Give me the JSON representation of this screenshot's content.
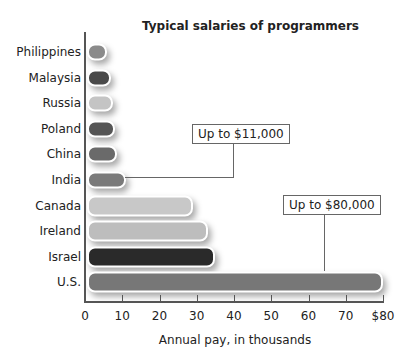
{
  "chart_data": {
    "type": "bar",
    "orientation": "horizontal",
    "title": "Typical salaries of programmers",
    "xlabel": "Annual pay, in thousands",
    "ylabel": "",
    "xlim": [
      0,
      80
    ],
    "xticks": [
      "0",
      "10",
      "20",
      "30",
      "40",
      "50",
      "60",
      "70",
      "$80"
    ],
    "grid": false,
    "categories": [
      "Philippines",
      "Malaysia",
      "Russia",
      "Poland",
      "China",
      "India",
      "Canada",
      "Ireland",
      "Israel",
      "U.S."
    ],
    "values": [
      6,
      7,
      7.5,
      8,
      8.5,
      11,
      29,
      33,
      35,
      80
    ],
    "colors": [
      "#8a8a8a",
      "#4a4a4a",
      "#c4c4c4",
      "#555555",
      "#6a6a6a",
      "#7a7a7a",
      "#c8c8c8",
      "#bdbdbd",
      "#2a2a2a",
      "#777777"
    ],
    "annotations": [
      {
        "text": "Up to $11,000",
        "target": "India"
      },
      {
        "text": "Up to $80,000",
        "target": "U.S."
      }
    ]
  }
}
